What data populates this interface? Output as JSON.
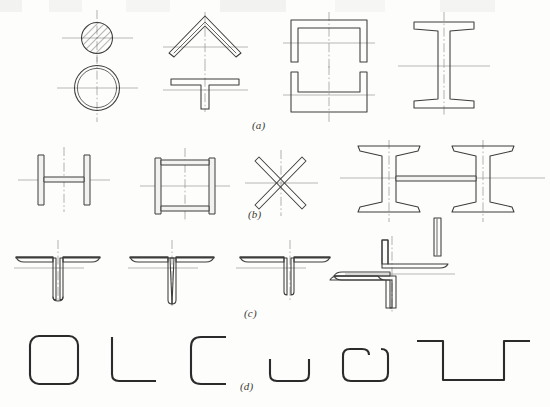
{
  "figure": {
    "background_color": "#fdfdfb",
    "outline_color": "#3c3c3c",
    "centerline_color": "#8c8c8c",
    "label_color": "#3a3a3a",
    "width": 550,
    "height": 407,
    "row_labels": {
      "a": "(a)",
      "b": "(b)",
      "c": "(c)",
      "d": "(d)"
    },
    "rows": [
      {
        "key": "a",
        "label": "(a)",
        "description": "Hot-rolled sections",
        "items": [
          {
            "name": "round-bar-solid",
            "note": "solid round bar, hatched"
          },
          {
            "name": "round-tube",
            "note": "circular hollow tube"
          },
          {
            "name": "angle-inverted-v",
            "note": "equal angle, apex up"
          },
          {
            "name": "tee-section",
            "note": "T section"
          },
          {
            "name": "channel-section-inverted",
            "note": "channel, opening down"
          },
          {
            "name": "channel-pair-web",
            "note": "channel, opening up"
          },
          {
            "name": "i-beam-section",
            "note": "I beam with tapered flanges"
          }
        ]
      },
      {
        "key": "b",
        "label": "(b)",
        "description": "Welded built-up sections",
        "items": [
          {
            "name": "welded-h-plate-section",
            "note": "H built from three plates"
          },
          {
            "name": "welded-box-section",
            "note": "box built from four plates"
          },
          {
            "name": "cross-bar-x",
            "note": "two flats crossed"
          },
          {
            "name": "twin-i-beam-section",
            "note": "two I beams joined by plate"
          }
        ]
      },
      {
        "key": "c",
        "label": "(c)",
        "description": "Angle combinations",
        "items": [
          {
            "name": "double-angle-tee-back-to-back",
            "note": "two angles back to back"
          },
          {
            "name": "double-angle-tee-closed",
            "note": "two angles, legs together"
          },
          {
            "name": "double-angle-tee-spaced",
            "note": "two angles, spaced"
          },
          {
            "name": "angle-pair-offset",
            "note": "two angles, point symmetric"
          }
        ]
      },
      {
        "key": "d",
        "label": "(d)",
        "description": "Cold-formed thin-walled sections",
        "items": [
          {
            "name": "square-hollow-section",
            "note": "square tube, rounded corners"
          },
          {
            "name": "angle-cold-formed",
            "note": "L angle"
          },
          {
            "name": "channel-cold-formed-wide",
            "note": "C channel"
          },
          {
            "name": "channel-cold-formed-narrow",
            "note": "shallow U channel"
          },
          {
            "name": "channel-cold-formed-lipped",
            "note": "lipped C channel"
          },
          {
            "name": "hat-section",
            "note": "hat / top-hat section"
          }
        ]
      }
    ]
  }
}
